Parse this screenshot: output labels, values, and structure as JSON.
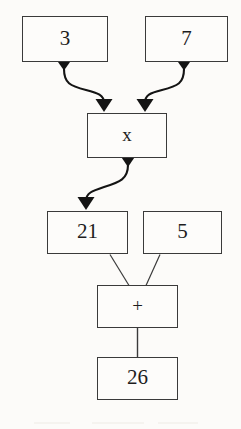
{
  "diagram": {
    "type": "flowchart",
    "expression": "3 x 7 = 21, 21 + 5 = 26",
    "stroke_color": "#3a3a3a",
    "arrow_color": "#141414",
    "background_color": "#fcfbf9",
    "text_color": "#1d1d1d",
    "nodes": [
      {
        "id": "operand-3",
        "label": "3",
        "kind": "operand",
        "x": 22,
        "y": 16,
        "w": 86,
        "h": 46
      },
      {
        "id": "operand-7",
        "label": "7",
        "kind": "operand",
        "x": 145,
        "y": 16,
        "w": 83,
        "h": 46
      },
      {
        "id": "operator-x",
        "label": "x",
        "kind": "operator",
        "x": 87,
        "y": 113,
        "w": 80,
        "h": 45
      },
      {
        "id": "operand-21",
        "label": "21",
        "kind": "operand",
        "x": 47,
        "y": 211,
        "w": 81,
        "h": 43
      },
      {
        "id": "operand-5",
        "label": "5",
        "kind": "operand",
        "x": 143,
        "y": 211,
        "w": 79,
        "h": 43
      },
      {
        "id": "operator-plus",
        "label": "+",
        "kind": "operator",
        "x": 97,
        "y": 285,
        "w": 81,
        "h": 43
      },
      {
        "id": "result-26",
        "label": "26",
        "kind": "result",
        "x": 97,
        "y": 357,
        "w": 81,
        "h": 43
      }
    ],
    "edges": [
      {
        "id": "edge-3-to-x",
        "from": "operand-3",
        "to": "operator-x",
        "style": "curved",
        "arrowheads": "both"
      },
      {
        "id": "edge-7-to-x",
        "from": "operand-7",
        "to": "operator-x",
        "style": "curved",
        "arrowheads": "both"
      },
      {
        "id": "edge-x-to-21",
        "from": "operator-x",
        "to": "operand-21",
        "style": "curved",
        "arrowheads": "both"
      },
      {
        "id": "edge-21-to-plus",
        "from": "operand-21",
        "to": "operator-plus",
        "style": "straight",
        "arrowheads": "none"
      },
      {
        "id": "edge-5-to-plus",
        "from": "operand-5",
        "to": "operator-plus",
        "style": "straight",
        "arrowheads": "none"
      },
      {
        "id": "edge-plus-to-26",
        "from": "operator-plus",
        "to": "result-26",
        "style": "straight",
        "arrowheads": "none"
      }
    ]
  }
}
